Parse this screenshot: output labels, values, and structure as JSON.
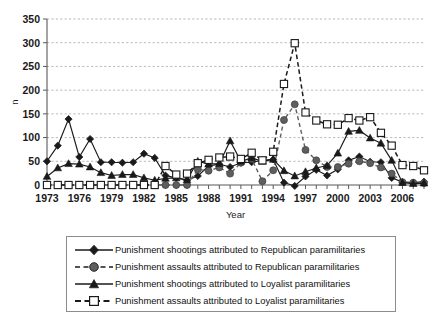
{
  "figure": {
    "background": "#ffffff",
    "border_color": "#8c8c8c"
  },
  "chart_data": {
    "type": "line",
    "title": "",
    "xlabel": "Year",
    "ylabel": "n",
    "ylim": [
      0,
      350
    ],
    "ytick_step": 50,
    "yticks": [
      0,
      50,
      100,
      150,
      200,
      250,
      300,
      350
    ],
    "xlim": [
      1973,
      2008
    ],
    "xtick_labels": [
      "1973",
      "1976",
      "1979",
      "1982",
      "1985",
      "1988",
      "1991",
      "1994",
      "1997",
      "2000",
      "2003",
      "2006"
    ],
    "xtick_values": [
      1973,
      1976,
      1979,
      1982,
      1985,
      1988,
      1991,
      1994,
      1997,
      2000,
      2003,
      2006
    ],
    "x": [
      1973,
      1974,
      1975,
      1976,
      1977,
      1978,
      1979,
      1980,
      1981,
      1982,
      1983,
      1984,
      1985,
      1986,
      1987,
      1988,
      1989,
      1990,
      1991,
      1992,
      1993,
      1994,
      1995,
      1996,
      1997,
      1998,
      1999,
      2000,
      2001,
      2002,
      2003,
      2004,
      2005,
      2006,
      2007,
      2008
    ],
    "grid": true,
    "grid_axis": "y",
    "legend_position": "below",
    "series": [
      {
        "name": "Punishment shootings attributed to Republican paramilitaries",
        "marker": "diamond-filled",
        "color": "#1a1a1a",
        "linestyle": "solid",
        "values": [
          50,
          83,
          139,
          59,
          97,
          48,
          48,
          47,
          48,
          66,
          57,
          20,
          15,
          10,
          19,
          40,
          44,
          38,
          47,
          48,
          52,
          54,
          5,
          -2,
          18,
          32,
          20,
          33,
          52,
          60,
          49,
          48,
          15,
          6,
          5,
          7
        ]
      },
      {
        "name": "Punishment assaults attributed to Republican paramilitaries",
        "marker": "circle-filled-gray",
        "color": "#5e5e5e",
        "linestyle": "dashed",
        "values": [
          0,
          0,
          0,
          0,
          0,
          0,
          0,
          0,
          0,
          0,
          0,
          0,
          0,
          0,
          33,
          30,
          37,
          24,
          47,
          55,
          8,
          31,
          137,
          170,
          74,
          52,
          38,
          38,
          45,
          50,
          46,
          37,
          24,
          6,
          5,
          4
        ]
      },
      {
        "name": "Punishment shootings attributed to Loyalist paramilitaries",
        "marker": "triangle-filled",
        "color": "#1a1a1a",
        "linestyle": "solid",
        "values": [
          18,
          36,
          45,
          44,
          38,
          26,
          20,
          22,
          22,
          15,
          10,
          14,
          15,
          11,
          50,
          44,
          45,
          93,
          50,
          57,
          50,
          54,
          30,
          19,
          28,
          36,
          41,
          67,
          113,
          115,
          99,
          88,
          52,
          5,
          3,
          4
        ]
      },
      {
        "name": "Punishment assaults attributed to Loyalist paramilitaries",
        "marker": "square-open",
        "color": "#1a1a1a",
        "linestyle": "dashed",
        "values": [
          0,
          0,
          0,
          0,
          0,
          0,
          0,
          0,
          0,
          0,
          0,
          40,
          22,
          24,
          46,
          53,
          58,
          60,
          55,
          68,
          52,
          70,
          213,
          299,
          153,
          136,
          128,
          127,
          141,
          136,
          143,
          110,
          83,
          42,
          40,
          31
        ]
      }
    ]
  },
  "legend": {
    "items": [
      {
        "label": "Punishment shootings attributed to Republican paramilitaries",
        "marker": "diamond-filled",
        "linestyle": "solid"
      },
      {
        "label": "Punishment assaults attributed to Republican paramilitaries",
        "marker": "circle-filled-gray",
        "linestyle": "dashed"
      },
      {
        "label": "Punishment shootings attributed to Loyalist paramilitaries",
        "marker": "triangle-filled",
        "linestyle": "solid"
      },
      {
        "label": "Punishment assaults attributed to Loyalist paramilitaries",
        "marker": "square-open",
        "linestyle": "dashed"
      }
    ]
  }
}
